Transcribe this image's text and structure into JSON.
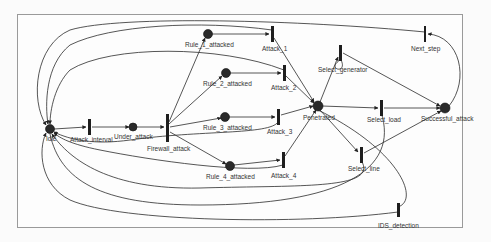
{
  "diagram": {
    "type": "petri-net",
    "colors": {
      "place": "#2a2a2a",
      "transition": "#1e1e1e",
      "arc": "#2b2b2b",
      "label": "#333333",
      "frame": "#9a9a9a"
    },
    "places": [
      {
        "id": "idle",
        "label": "Idle",
        "x": 50,
        "y": 129
      },
      {
        "id": "under_attack",
        "label": "Under_attack",
        "x": 133,
        "y": 127
      },
      {
        "id": "rule1",
        "label": "Rule_1_attacked",
        "x": 208,
        "y": 34
      },
      {
        "id": "rule2",
        "label": "Rule_2_attacked",
        "x": 226,
        "y": 73
      },
      {
        "id": "rule3",
        "label": "Rule_3_attacked",
        "x": 225,
        "y": 117
      },
      {
        "id": "rule4",
        "label": "Rule_4_attacked",
        "x": 230,
        "y": 166
      },
      {
        "id": "penetrated",
        "label": "Penetrated",
        "x": 318,
        "y": 106
      },
      {
        "id": "successful",
        "label": "Successful_attack",
        "x": 445,
        "y": 108
      }
    ],
    "transitions": [
      {
        "id": "attack_interval",
        "label": "Attack_interval",
        "x": 89,
        "y": 127
      },
      {
        "id": "firewall_attack",
        "label": "Firewall_attack",
        "x": 167,
        "y": 128
      },
      {
        "id": "attack1",
        "label": "Attack_1",
        "x": 272,
        "y": 34
      },
      {
        "id": "attack2",
        "label": "Attack_2",
        "x": 284,
        "y": 73
      },
      {
        "id": "attack3",
        "label": "Attack_3",
        "x": 278,
        "y": 117
      },
      {
        "id": "attack4",
        "label": "Attack_4",
        "x": 283,
        "y": 160
      },
      {
        "id": "select_generator",
        "label": "Select_generator",
        "x": 340,
        "y": 53
      },
      {
        "id": "next_step",
        "label": "Next_step",
        "x": 425,
        "y": 34
      },
      {
        "id": "select_load",
        "label": "Select_load",
        "x": 381,
        "y": 108
      },
      {
        "id": "select_line",
        "label": "Select_line",
        "x": 361,
        "y": 155
      },
      {
        "id": "ids_detection",
        "label": "IDS_detection",
        "x": 398,
        "y": 210
      }
    ]
  }
}
